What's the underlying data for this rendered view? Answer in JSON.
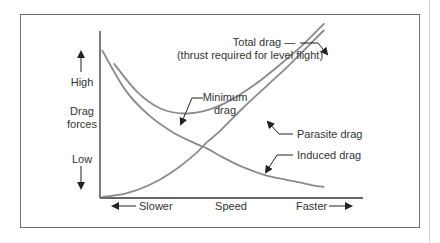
{
  "chart_data": {
    "type": "line",
    "title": "",
    "xlabel": "Speed",
    "ylabel": "Drag forces",
    "x_axis": {
      "left_label": "Slower",
      "center_label": "Speed",
      "right_label": "Faster"
    },
    "y_axis": {
      "top_label": "High",
      "middle_label_1": "Drag",
      "middle_label_2": "forces",
      "bottom_label": "Low"
    },
    "xlim": [
      0,
      10
    ],
    "ylim": [
      0,
      10
    ],
    "grid": false,
    "series": [
      {
        "name": "Total drag",
        "annotation": [
          "Total drag —",
          "(thrust required for level flight)"
        ],
        "x": [
          0.5,
          1.5,
          2.5,
          3.5,
          4.5,
          5.5,
          6.5,
          7.5,
          8.5,
          9.5
        ],
        "y": [
          8.0,
          6.3,
          5.3,
          5.0,
          5.2,
          5.8,
          6.7,
          7.8,
          9.0,
          10.4
        ]
      },
      {
        "name": "Parasite drag",
        "annotation": [
          "Parasite drag"
        ],
        "x": [
          0,
          1,
          2,
          3,
          4,
          4.5,
          5,
          6,
          7,
          8,
          9,
          9.5
        ],
        "y": [
          0,
          0.2,
          0.7,
          1.5,
          2.6,
          3.3,
          3.9,
          5.3,
          6.6,
          7.9,
          9.3,
          10.0
        ]
      },
      {
        "name": "Induced drag",
        "annotation": [
          "Induced drag"
        ],
        "x": [
          0,
          1,
          2,
          3,
          4,
          4.5,
          5,
          6,
          7,
          8,
          9,
          9.5
        ],
        "y": [
          8.8,
          6.4,
          4.9,
          3.9,
          3.2,
          2.9,
          2.5,
          1.8,
          1.3,
          1.0,
          0.7,
          0.6
        ]
      }
    ],
    "annotations": [
      {
        "text": [
          "Minimum",
          "drag"
        ],
        "target": "Total drag minimum"
      }
    ]
  }
}
